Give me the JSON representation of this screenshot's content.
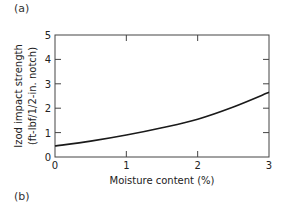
{
  "panels": {
    "top_label": "(a)",
    "bottom_label": "(b)"
  },
  "chart_data": {
    "type": "line",
    "title": "",
    "xlabel": "Moisture content (%)",
    "ylabel_line1": "Izod impact strength",
    "ylabel_line2": "(ft-lbf/1/2-in. notch)",
    "xlim": [
      0,
      3
    ],
    "ylim": [
      0,
      5
    ],
    "x_ticks": [
      "0",
      "1",
      "2",
      "3"
    ],
    "y_ticks": [
      "0",
      "1",
      "2",
      "3",
      "4",
      "5"
    ],
    "grid": false,
    "legend": null,
    "series": [
      {
        "name": "Izod impact strength",
        "x": [
          0,
          0.5,
          1,
          1.5,
          2,
          2.5,
          3
        ],
        "y": [
          0.45,
          0.65,
          0.9,
          1.2,
          1.55,
          2.05,
          2.65
        ]
      }
    ]
  }
}
